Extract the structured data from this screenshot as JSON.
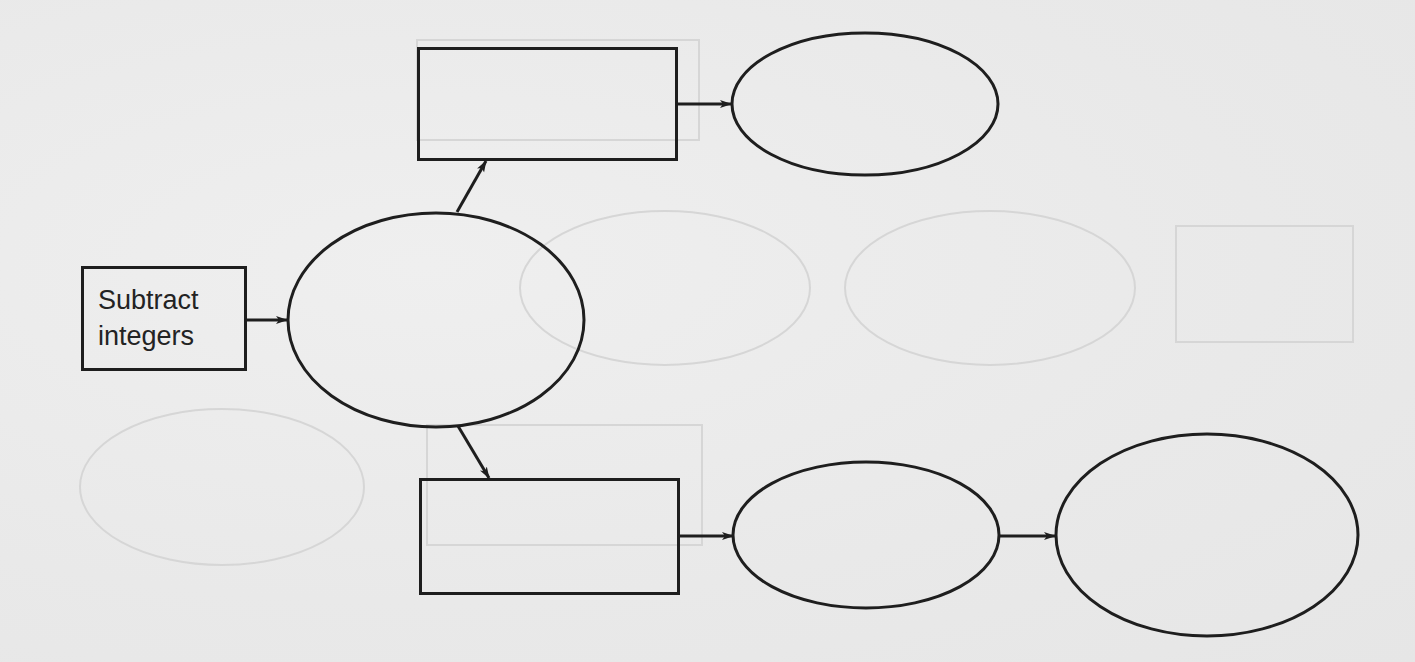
{
  "diagram": {
    "type": "concept-map",
    "colors": {
      "stroke": "#1e1e1e",
      "background": "#ebebeb",
      "text": "#232323",
      "show_through": "#d6d6d6"
    },
    "nodes": [
      {
        "id": "subtract-integers",
        "shape": "rectangle",
        "label_lines": [
          "Subtract",
          "integers"
        ]
      },
      {
        "id": "center-ellipse",
        "shape": "ellipse",
        "label_lines": []
      },
      {
        "id": "top-rectangle",
        "shape": "rectangle",
        "label_lines": []
      },
      {
        "id": "top-ellipse",
        "shape": "ellipse",
        "label_lines": []
      },
      {
        "id": "bottom-rectangle",
        "shape": "rectangle",
        "label_lines": []
      },
      {
        "id": "bottom-middle-ellipse",
        "shape": "ellipse",
        "label_lines": []
      },
      {
        "id": "bottom-right-ellipse",
        "shape": "ellipse",
        "label_lines": []
      }
    ],
    "edges": [
      {
        "from": "subtract-integers",
        "to": "center-ellipse"
      },
      {
        "from": "center-ellipse",
        "to": "top-rectangle"
      },
      {
        "from": "center-ellipse",
        "to": "bottom-rectangle"
      },
      {
        "from": "top-rectangle",
        "to": "top-ellipse"
      },
      {
        "from": "bottom-rectangle",
        "to": "bottom-middle-ellipse"
      },
      {
        "from": "bottom-middle-ellipse",
        "to": "bottom-right-ellipse"
      }
    ]
  }
}
